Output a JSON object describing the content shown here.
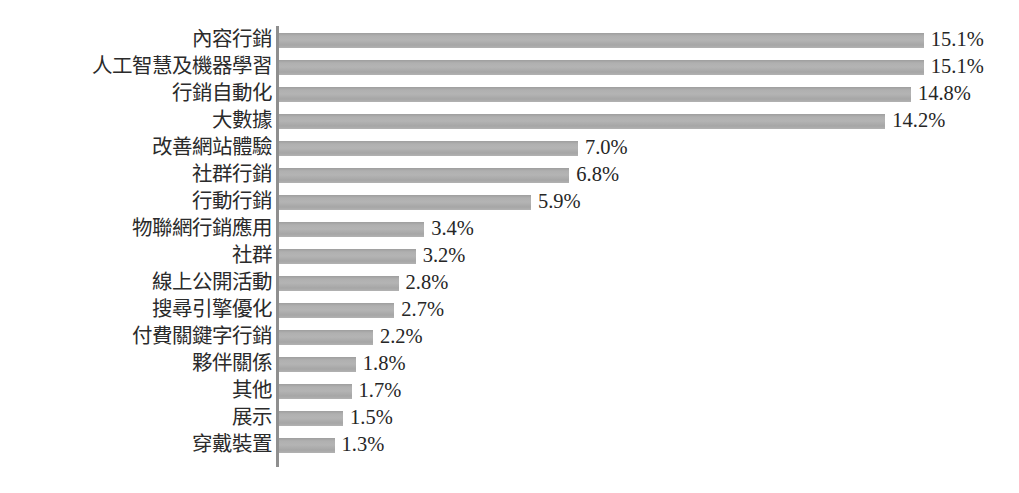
{
  "chart_data": {
    "type": "bar",
    "orientation": "horizontal",
    "title": "",
    "subtitle": "",
    "xlabel": "",
    "ylabel": "",
    "grid": false,
    "legend": false,
    "legend_position": "none",
    "axis_color": "#8f8f8f",
    "bar_color": "#adadad",
    "value_suffix": "%",
    "xlim": [
      0,
      15.1
    ],
    "categories": [
      "內容行銷",
      "人工智慧及機器學習",
      "行銷自動化",
      "大數據",
      "改善網站體驗",
      "社群行銷",
      "行動行銷",
      "物聯網行銷應用",
      "社群",
      "線上公開活動",
      "搜尋引擎優化",
      "付費關鍵字行銷",
      "夥伴關係",
      "其他",
      "展示",
      "穿戴裝置"
    ],
    "values": [
      15.1,
      15.1,
      14.8,
      14.2,
      7.0,
      6.8,
      5.9,
      3.4,
      3.2,
      2.8,
      2.7,
      2.2,
      1.8,
      1.7,
      1.5,
      1.3
    ],
    "value_labels": [
      "15.1%",
      "15.1%",
      "14.8%",
      "14.2%",
      "7.0%",
      "6.8%",
      "5.9%",
      "3.4%",
      "3.2%",
      "2.8%",
      "2.7%",
      "2.2%",
      "1.8%",
      "1.7%",
      "1.5%",
      "1.3%"
    ]
  }
}
